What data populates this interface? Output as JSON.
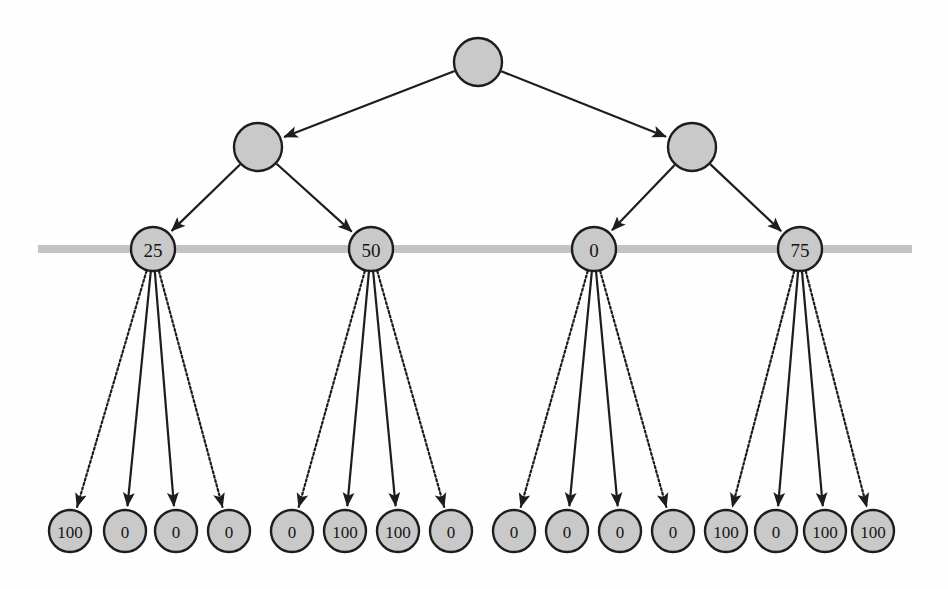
{
  "figure": {
    "title": "",
    "background_color": "#fefefe",
    "node_fill": "#c9c9c9",
    "node_stroke": "#1d1d1d",
    "edge_color": "#1d1d1d",
    "cut_line_color": "#c4c4c4"
  },
  "chart_data": {
    "type": "diagram",
    "diagram_kind": "tree",
    "title": "",
    "levels": 4,
    "cut_line": {
      "label": "",
      "y": 249,
      "x_start": 38,
      "x_end": 912,
      "color": "#c4c4c4",
      "thickness": 8
    },
    "nodes": {
      "level1": [
        {
          "id": "root",
          "label": "",
          "x": 478,
          "y": 62,
          "r": 24
        }
      ],
      "level2": [
        {
          "id": "n2a",
          "label": "",
          "x": 258,
          "y": 147,
          "r": 24
        },
        {
          "id": "n2b",
          "label": "",
          "x": 692,
          "y": 147,
          "r": 24
        }
      ],
      "level3": [
        {
          "id": "n3a",
          "label": "25",
          "x": 153,
          "y": 249,
          "r": 22
        },
        {
          "id": "n3b",
          "label": "50",
          "x": 371,
          "y": 249,
          "r": 22
        },
        {
          "id": "n3c",
          "label": "0",
          "x": 594,
          "y": 249,
          "r": 22
        },
        {
          "id": "n3d",
          "label": "75",
          "x": 800,
          "y": 249,
          "r": 22
        }
      ],
      "leaves": [
        {
          "id": "l1",
          "label": "100",
          "x": 70,
          "y": 531,
          "r": 21,
          "parent": "n3a",
          "edge": "dotted"
        },
        {
          "id": "l2",
          "label": "0",
          "x": 125,
          "y": 531,
          "r": 21,
          "parent": "n3a",
          "edge": "solid"
        },
        {
          "id": "l3",
          "label": "0",
          "x": 176,
          "y": 531,
          "r": 21,
          "parent": "n3a",
          "edge": "solid"
        },
        {
          "id": "l4",
          "label": "0",
          "x": 229,
          "y": 531,
          "r": 21,
          "parent": "n3a",
          "edge": "dotted"
        },
        {
          "id": "l5",
          "label": "0",
          "x": 292,
          "y": 531,
          "r": 21,
          "parent": "n3b",
          "edge": "dotted"
        },
        {
          "id": "l6",
          "label": "100",
          "x": 345,
          "y": 531,
          "r": 21,
          "parent": "n3b",
          "edge": "solid"
        },
        {
          "id": "l7",
          "label": "100",
          "x": 398,
          "y": 531,
          "r": 21,
          "parent": "n3b",
          "edge": "solid"
        },
        {
          "id": "l8",
          "label": "0",
          "x": 451,
          "y": 531,
          "r": 21,
          "parent": "n3b",
          "edge": "dotted"
        },
        {
          "id": "l9",
          "label": "0",
          "x": 514,
          "y": 531,
          "r": 21,
          "parent": "n3c",
          "edge": "dotted"
        },
        {
          "id": "l10",
          "label": "0",
          "x": 567,
          "y": 531,
          "r": 21,
          "parent": "n3c",
          "edge": "solid"
        },
        {
          "id": "l11",
          "label": "0",
          "x": 620,
          "y": 531,
          "r": 21,
          "parent": "n3c",
          "edge": "solid"
        },
        {
          "id": "l12",
          "label": "0",
          "x": 673,
          "y": 531,
          "r": 21,
          "parent": "n3c",
          "edge": "dotted"
        },
        {
          "id": "l13",
          "label": "100",
          "x": 726,
          "y": 531,
          "r": 21,
          "parent": "n3d",
          "edge": "dotted"
        },
        {
          "id": "l14",
          "label": "0",
          "x": 776,
          "y": 531,
          "r": 21,
          "parent": "n3d",
          "edge": "solid"
        },
        {
          "id": "l15",
          "label": "100",
          "x": 825,
          "y": 531,
          "r": 21,
          "parent": "n3d",
          "edge": "solid"
        },
        {
          "id": "l16",
          "label": "100",
          "x": 873,
          "y": 531,
          "r": 21,
          "parent": "n3d",
          "edge": "dotted"
        }
      ]
    },
    "edges": [
      {
        "from": "root",
        "to": "n2a",
        "style": "solid",
        "arrow": true
      },
      {
        "from": "root",
        "to": "n2b",
        "style": "solid",
        "arrow": true
      },
      {
        "from": "n2a",
        "to": "n3a",
        "style": "solid",
        "arrow": true
      },
      {
        "from": "n2a",
        "to": "n3b",
        "style": "solid",
        "arrow": true
      },
      {
        "from": "n2b",
        "to": "n3c",
        "style": "solid",
        "arrow": true
      },
      {
        "from": "n2b",
        "to": "n3d",
        "style": "solid",
        "arrow": true
      },
      {
        "from": "n3a",
        "to": "l1",
        "style": "dotted",
        "arrow": true
      },
      {
        "from": "n3a",
        "to": "l2",
        "style": "solid",
        "arrow": true
      },
      {
        "from": "n3a",
        "to": "l3",
        "style": "solid",
        "arrow": true
      },
      {
        "from": "n3a",
        "to": "l4",
        "style": "dotted",
        "arrow": true
      },
      {
        "from": "n3b",
        "to": "l5",
        "style": "dotted",
        "arrow": true
      },
      {
        "from": "n3b",
        "to": "l6",
        "style": "solid",
        "arrow": true
      },
      {
        "from": "n3b",
        "to": "l7",
        "style": "solid",
        "arrow": true
      },
      {
        "from": "n3b",
        "to": "l8",
        "style": "dotted",
        "arrow": true
      },
      {
        "from": "n3c",
        "to": "l9",
        "style": "dotted",
        "arrow": true
      },
      {
        "from": "n3c",
        "to": "l10",
        "style": "solid",
        "arrow": true
      },
      {
        "from": "n3c",
        "to": "l11",
        "style": "solid",
        "arrow": true
      },
      {
        "from": "n3c",
        "to": "l12",
        "style": "dotted",
        "arrow": true
      },
      {
        "from": "n3d",
        "to": "l13",
        "style": "dotted",
        "arrow": true
      },
      {
        "from": "n3d",
        "to": "l14",
        "style": "solid",
        "arrow": true
      },
      {
        "from": "n3d",
        "to": "l15",
        "style": "solid",
        "arrow": true
      },
      {
        "from": "n3d",
        "to": "l16",
        "style": "dotted",
        "arrow": true
      }
    ],
    "leaf_values": [
      100,
      0,
      0,
      0,
      0,
      100,
      100,
      0,
      0,
      0,
      0,
      0,
      100,
      0,
      100,
      100
    ],
    "level3_values": [
      25,
      50,
      0,
      75
    ]
  }
}
